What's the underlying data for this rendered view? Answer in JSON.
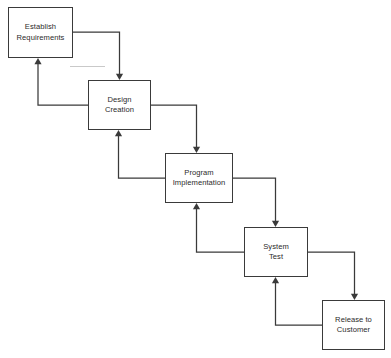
{
  "diagram": {
    "type": "flowchart",
    "canvas": {
      "width": 391,
      "height": 358,
      "background": "#ffffff"
    },
    "style": {
      "box_fill": "#ffffff",
      "box_stroke": "#3a3a3a",
      "connector_stroke": "#3a3a3a",
      "text_color": "#2b2b2b",
      "artifact_stroke": "#c9c9c9"
    },
    "nodes": [
      {
        "id": "establish-requirements",
        "label": "Establish\nRequirements",
        "x": 8,
        "y": 7,
        "w": 65,
        "h": 51
      },
      {
        "id": "design-creation",
        "label": "Design\nCreation",
        "x": 88,
        "y": 80,
        "w": 63,
        "h": 50
      },
      {
        "id": "program-implementation",
        "label": "Program\nImplementation",
        "x": 165,
        "y": 153,
        "w": 68,
        "h": 50
      },
      {
        "id": "system-test",
        "label": "System\nTest",
        "x": 244,
        "y": 227,
        "w": 64,
        "h": 50
      },
      {
        "id": "release-to-customer",
        "label": "Release to\nCustomer",
        "x": 322,
        "y": 300,
        "w": 63,
        "h": 50
      }
    ],
    "connectors": [
      {
        "id": "forward-requirements-to-design",
        "direction": "forward",
        "from": "establish-requirements",
        "to": "design-creation",
        "path": "M 73 32 L 119.5 32 L 119.5 74",
        "arrow": {
          "x": 119.5,
          "y": 80,
          "dir": "down"
        }
      },
      {
        "id": "backward-design-to-requirements",
        "direction": "backward",
        "from": "design-creation",
        "to": "establish-requirements",
        "path": "M 88 105 L 38 105 L 38 64",
        "arrow": {
          "x": 38,
          "y": 58,
          "dir": "up"
        }
      },
      {
        "id": "forward-design-to-program",
        "direction": "forward",
        "from": "design-creation",
        "to": "program-implementation",
        "path": "M 151 105 L 196.5 105 L 196.5 147",
        "arrow": {
          "x": 196.5,
          "y": 153,
          "dir": "down"
        }
      },
      {
        "id": "backward-program-to-design",
        "direction": "backward",
        "from": "program-implementation",
        "to": "design-creation",
        "path": "M 165 178 L 118.5 178 L 118.5 136",
        "arrow": {
          "x": 118.5,
          "y": 130,
          "dir": "up"
        }
      },
      {
        "id": "forward-program-to-system-test",
        "direction": "forward",
        "from": "program-implementation",
        "to": "system-test",
        "path": "M 233 178 L 275.5 178 L 275.5 221",
        "arrow": {
          "x": 275.5,
          "y": 227,
          "dir": "down"
        }
      },
      {
        "id": "backward-system-test-to-program",
        "direction": "backward",
        "from": "system-test",
        "to": "program-implementation",
        "path": "M 244 252 L 196.5 252 L 196.5 209",
        "arrow": {
          "x": 196.5,
          "y": 203,
          "dir": "up"
        }
      },
      {
        "id": "forward-system-test-to-release",
        "direction": "forward",
        "from": "system-test",
        "to": "release-to-customer",
        "path": "M 308 252 L 354.5 252 L 354.5 294",
        "arrow": {
          "x": 354.5,
          "y": 300,
          "dir": "down"
        }
      },
      {
        "id": "backward-release-to-system-test",
        "direction": "backward",
        "from": "release-to-customer",
        "to": "system-test",
        "path": "M 322 325 L 275.5 325 L 275.5 283",
        "arrow": {
          "x": 275.5,
          "y": 277,
          "dir": "up"
        }
      }
    ],
    "artifacts": [
      {
        "id": "stray-gray-line",
        "path": "M 70 66.5 L 105 66.5"
      }
    ]
  }
}
